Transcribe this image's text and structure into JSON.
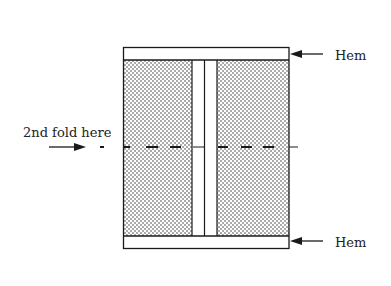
{
  "diagram": {
    "labels": {
      "hem_top": "Hem",
      "hem_bottom": "Hem",
      "fold": "2nd fold here"
    },
    "colors": {
      "line": "#1a1a1a",
      "background": "#ffffff",
      "stipple": "#2a2a2a"
    }
  }
}
